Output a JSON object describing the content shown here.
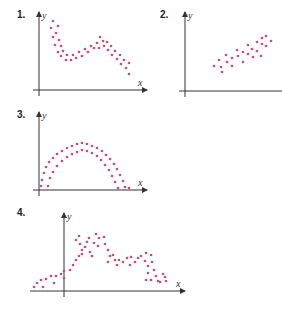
{
  "chart_data": [
    {
      "type": "scatter",
      "label": "1.",
      "xlabel": "x",
      "ylabel": "y",
      "grid": false,
      "description": "Decreasing band with a bump: falls, rises, then falls again",
      "axis": {
        "origin": [
          39,
          90
        ],
        "x_end": 147,
        "y_top": 12
      },
      "points": [
        [
          53,
          21
        ],
        [
          58,
          26
        ],
        [
          51,
          28
        ],
        [
          56,
          33
        ],
        [
          53,
          37
        ],
        [
          59,
          40
        ],
        [
          55,
          45
        ],
        [
          61,
          46
        ],
        [
          58,
          52
        ],
        [
          63,
          51
        ],
        [
          61,
          56
        ],
        [
          67,
          55
        ],
        [
          66,
          60
        ],
        [
          71,
          60
        ],
        [
          73,
          55
        ],
        [
          76,
          58
        ],
        [
          79,
          52
        ],
        [
          82,
          56
        ],
        [
          85,
          49
        ],
        [
          88,
          52
        ],
        [
          91,
          46
        ],
        [
          94,
          48
        ],
        [
          97,
          43
        ],
        [
          99,
          48
        ],
        [
          100,
          37
        ],
        [
          103,
          41
        ],
        [
          104,
          46
        ],
        [
          107,
          42
        ],
        [
          108,
          50
        ],
        [
          111,
          46
        ],
        [
          112,
          55
        ],
        [
          115,
          51
        ],
        [
          117,
          59
        ],
        [
          120,
          55
        ],
        [
          121,
          64
        ],
        [
          124,
          60
        ],
        [
          126,
          68
        ],
        [
          129,
          63
        ],
        [
          129,
          74
        ]
      ]
    },
    {
      "type": "scatter",
      "label": "2.",
      "xlabel": "",
      "ylabel": "y",
      "grid": false,
      "description": "Positive linear band",
      "axis": {
        "origin": [
          185,
          91
        ],
        "x_end": 282,
        "y_top": 12
      },
      "points": [
        [
          214,
          66
        ],
        [
          219,
          60
        ],
        [
          221,
          67
        ],
        [
          226,
          55
        ],
        [
          227,
          62
        ],
        [
          222,
          72
        ],
        [
          232,
          58
        ],
        [
          232,
          66
        ],
        [
          237,
          50
        ],
        [
          238,
          56
        ],
        [
          243,
          52
        ],
        [
          243,
          62
        ],
        [
          248,
          45
        ],
        [
          248,
          54
        ],
        [
          252,
          49
        ],
        [
          253,
          57
        ],
        [
          257,
          42
        ],
        [
          257,
          51
        ],
        [
          262,
          44
        ],
        [
          262,
          38
        ],
        [
          266,
          36
        ],
        [
          266,
          46
        ],
        [
          271,
          41
        ],
        [
          261,
          56
        ]
      ]
    },
    {
      "type": "scatter",
      "label": "3.",
      "xlabel": "x",
      "ylabel": "y",
      "grid": false,
      "description": "Inverted-U arch (quadratic)",
      "axis": {
        "origin": [
          39,
          190
        ],
        "x_end": 147,
        "y_top": 112
      },
      "points": [
        [
          41,
          186
        ],
        [
          42,
          180
        ],
        [
          44,
          173
        ],
        [
          46,
          167
        ],
        [
          49,
          162
        ],
        [
          53,
          158
        ],
        [
          57,
          154
        ],
        [
          62,
          151
        ],
        [
          67,
          148
        ],
        [
          72,
          146
        ],
        [
          77,
          144
        ],
        [
          82,
          143
        ],
        [
          87,
          144
        ],
        [
          92,
          146
        ],
        [
          97,
          148
        ],
        [
          102,
          151
        ],
        [
          106,
          155
        ],
        [
          110,
          159
        ],
        [
          114,
          164
        ],
        [
          117,
          169
        ],
        [
          120,
          175
        ],
        [
          123,
          181
        ],
        [
          125,
          187
        ],
        [
          48,
          186
        ],
        [
          50,
          178
        ],
        [
          53,
          172
        ],
        [
          57,
          166
        ],
        [
          62,
          161
        ],
        [
          67,
          157
        ],
        [
          72,
          154
        ],
        [
          77,
          152
        ],
        [
          82,
          150
        ],
        [
          87,
          151
        ],
        [
          92,
          153
        ],
        [
          97,
          156
        ],
        [
          101,
          160
        ],
        [
          105,
          165
        ],
        [
          109,
          170
        ],
        [
          112,
          176
        ],
        [
          115,
          182
        ],
        [
          118,
          188
        ],
        [
          129,
          188
        ]
      ]
    },
    {
      "type": "scatter",
      "label": "4.",
      "xlabel": "x",
      "ylabel": "y",
      "grid": false,
      "description": "Irregular rise with peaks then decline and cluster",
      "axis": {
        "origin": [
          64,
          291
        ],
        "x_end": 185,
        "y_top": 213
      },
      "points": [
        [
          34,
          287
        ],
        [
          37,
          283
        ],
        [
          41,
          280
        ],
        [
          43,
          287
        ],
        [
          46,
          279
        ],
        [
          51,
          276
        ],
        [
          54,
          283
        ],
        [
          56,
          276
        ],
        [
          61,
          274
        ],
        [
          64,
          271
        ],
        [
          64,
          278
        ],
        [
          70,
          270
        ],
        [
          73,
          265
        ],
        [
          76,
          260
        ],
        [
          79,
          256
        ],
        [
          76,
          240
        ],
        [
          79,
          236
        ],
        [
          80,
          244
        ],
        [
          82,
          250
        ],
        [
          85,
          247
        ],
        [
          82,
          254
        ],
        [
          87,
          242
        ],
        [
          89,
          238
        ],
        [
          90,
          252
        ],
        [
          94,
          243
        ],
        [
          92,
          256
        ],
        [
          96,
          234
        ],
        [
          99,
          238
        ],
        [
          98,
          246
        ],
        [
          104,
          237
        ],
        [
          105,
          244
        ],
        [
          108,
          250
        ],
        [
          110,
          256
        ],
        [
          108,
          262
        ],
        [
          113,
          255
        ],
        [
          115,
          260
        ],
        [
          117,
          265
        ],
        [
          119,
          260
        ],
        [
          123,
          262
        ],
        [
          127,
          258
        ],
        [
          131,
          257
        ],
        [
          130,
          265
        ],
        [
          135,
          262
        ],
        [
          138,
          258
        ],
        [
          141,
          256
        ],
        [
          145,
          261
        ],
        [
          146,
          253
        ],
        [
          148,
          266
        ],
        [
          148,
          273
        ],
        [
          151,
          255
        ],
        [
          152,
          262
        ],
        [
          151,
          280
        ],
        [
          154,
          270
        ],
        [
          156,
          276
        ],
        [
          158,
          281
        ],
        [
          160,
          282
        ],
        [
          163,
          274
        ],
        [
          165,
          277
        ],
        [
          166,
          281
        ],
        [
          146,
          280
        ]
      ]
    }
  ]
}
